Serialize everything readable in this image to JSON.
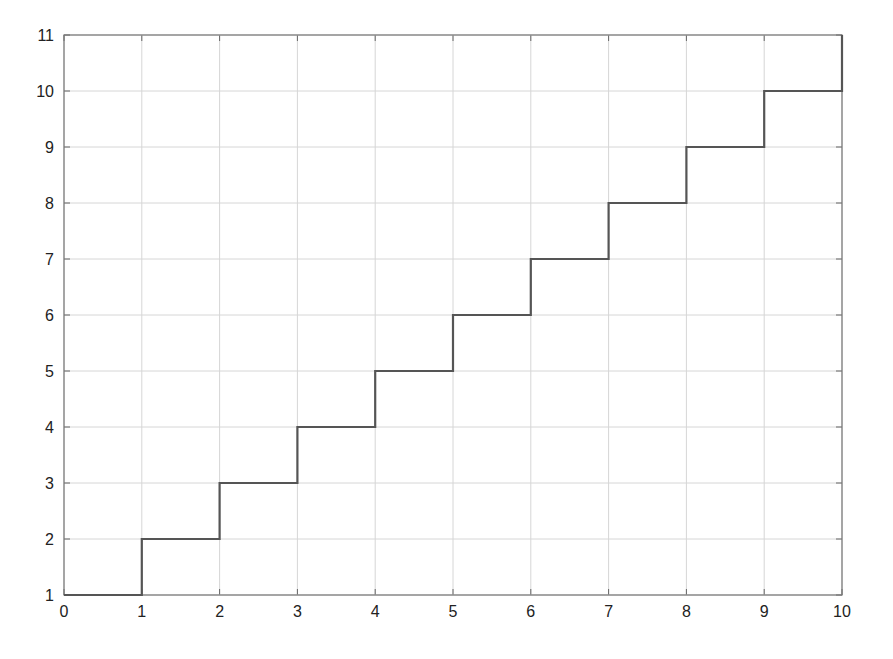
{
  "chart_data": {
    "type": "line",
    "title": "",
    "xlabel": "",
    "ylabel": "",
    "xlim": [
      0,
      10
    ],
    "ylim": [
      1,
      11
    ],
    "grid": true,
    "legend": null,
    "x_ticks": [
      "0",
      "1",
      "2",
      "3",
      "4",
      "5",
      "6",
      "7",
      "8",
      "9",
      "10"
    ],
    "y_ticks": [
      "1",
      "2",
      "3",
      "4",
      "5",
      "6",
      "7",
      "8",
      "9",
      "10",
      "11"
    ],
    "series": [
      {
        "name": "staircase",
        "style": "stairs",
        "color": "#555555",
        "x": [
          0,
          1,
          1,
          2,
          2,
          3,
          3,
          4,
          4,
          5,
          5,
          6,
          6,
          7,
          7,
          8,
          8,
          9,
          9,
          10,
          10
        ],
        "y": [
          1,
          1,
          2,
          2,
          3,
          3,
          4,
          4,
          5,
          5,
          6,
          6,
          7,
          7,
          8,
          8,
          9,
          9,
          10,
          10,
          11
        ]
      }
    ]
  }
}
